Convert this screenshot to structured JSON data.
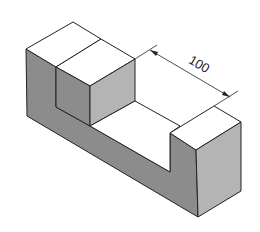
{
  "figure": {
    "type": "isometric technical drawing",
    "dimension": {
      "label": "100",
      "measures": "slot length"
    },
    "colors": {
      "background": "#ffffff",
      "top_face": "#ffffff",
      "left_face": "#8c8c8c",
      "right_face": "#b4b4b4",
      "edge": "#222222"
    }
  }
}
